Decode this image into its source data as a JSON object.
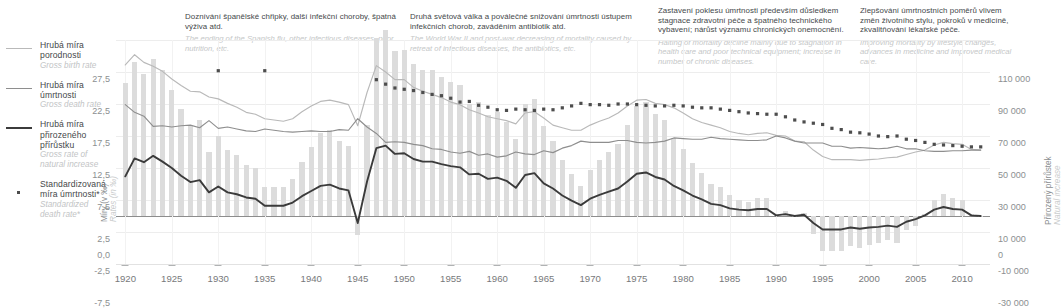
{
  "legend": {
    "items": [
      {
        "cz": "Hrubá míra porodnosti",
        "en": "Gross birth rate",
        "marker": "line-light",
        "color": "#b9b9b9"
      },
      {
        "cz": "Hrubá míra úmrtnosti",
        "en": "Gross death rate",
        "marker": "line-medium",
        "color": "#8e8e8e"
      },
      {
        "cz": "Hrubá míra přirozeného přírůstku",
        "en": "Gross rate of natural increase",
        "marker": "line-bold",
        "color": "#3b3b3b"
      },
      {
        "cz": "Standardizovaná míra úmrtnosti*",
        "en": "Standardized death rate*",
        "marker": "dot",
        "color": "#4d4d4d"
      }
    ]
  },
  "annotations": [
    {
      "cz": "Doznívání španělské chřipky, další infekční choroby, špatná výživa atd.",
      "en": "The ending of the Spanish flu, other infectious diseases, poor nutrition, etc."
    },
    {
      "cz": "Druhá světová válka a poválečné snižování úmrtnosti ústupem infekčních chorob, zaváděním antibiotik atd.",
      "en": "The World War II and post-war decreasing of mortality caused by retreat of infectious diseases, the antibiotics, etc."
    },
    {
      "cz": "Zastavení poklesu úmrtnosti především důsledkem stagnace zdravotní péče a špatného technického vybavení; nárůst významu chronických onemocnění.",
      "en": "Halting of mortality decline mainly due to stagnation in health care and poor technical equipment; increase in number of chronic diseases."
    },
    {
      "cz": "Zlepšování úmrtnostních poměrů vlivem změn životního stylu, pokroků v medicíně, zkvalitňování lékařské péče.",
      "en": "Improving mortality by lifestyle changes, advances in medicine and improved medical care."
    }
  ],
  "chart_data": {
    "type": "line",
    "title": "",
    "xlabel": "",
    "ylabel_left_cz": "Míry (v ‰)",
    "ylabel_left_en": "Rates (in ‰)",
    "ylabel_right_cz": "Přirozený přírůstek",
    "ylabel_right_en": "Natural increase",
    "ylim_left": [
      -7.5,
      27.5
    ],
    "ylim_right": [
      -30000,
      110000
    ],
    "yticks_left": [
      "27,5",
      "22,5",
      "17,5",
      "12,5",
      "7,5",
      "2,5",
      "0,0",
      "-2,5",
      "-7,5"
    ],
    "yticks_left_values": [
      27.5,
      22.5,
      17.5,
      12.5,
      7.5,
      2.5,
      0.0,
      -2.5,
      -7.5
    ],
    "yticks_right": [
      "110 000",
      "90 000",
      "70 000",
      "50 000",
      "30 000",
      "10 000",
      "0",
      "-10 000",
      "-30 000"
    ],
    "yticks_right_values": [
      110000,
      90000,
      70000,
      50000,
      30000,
      10000,
      0,
      -10000,
      -30000
    ],
    "xticks": [
      "1920",
      "1925",
      "1930",
      "1935",
      "1940",
      "1945",
      "1950",
      "1955",
      "1960",
      "1965",
      "1970",
      "1975",
      "1980",
      "1985",
      "1990",
      "1995",
      "2000",
      "2005",
      "2010"
    ],
    "xticks_values": [
      1920,
      1925,
      1930,
      1935,
      1940,
      1945,
      1950,
      1955,
      1960,
      1965,
      1970,
      1975,
      1980,
      1985,
      1990,
      1995,
      2000,
      2005,
      2010
    ],
    "xlim": [
      1919,
      2013
    ],
    "grid": true,
    "legend_position": "left-outside",
    "years": [
      1920,
      1921,
      1922,
      1923,
      1924,
      1925,
      1926,
      1927,
      1928,
      1929,
      1930,
      1931,
      1932,
      1933,
      1934,
      1935,
      1936,
      1937,
      1938,
      1939,
      1940,
      1941,
      1942,
      1943,
      1944,
      1945,
      1946,
      1947,
      1948,
      1949,
      1950,
      1951,
      1952,
      1953,
      1954,
      1955,
      1956,
      1957,
      1958,
      1959,
      1960,
      1961,
      1962,
      1963,
      1964,
      1965,
      1966,
      1967,
      1968,
      1969,
      1970,
      1971,
      1972,
      1973,
      1974,
      1975,
      1976,
      1977,
      1978,
      1979,
      1980,
      1981,
      1982,
      1983,
      1984,
      1985,
      1986,
      1987,
      1988,
      1989,
      1990,
      1991,
      1992,
      1993,
      1994,
      1995,
      1996,
      1997,
      1998,
      1999,
      2000,
      2001,
      2002,
      2003,
      2004,
      2005,
      2006,
      2007,
      2008,
      2009,
      2010,
      2011,
      2012
    ],
    "series": [
      {
        "name": "Hrubá míra porodnosti",
        "en_name": "Gross birth rate",
        "axis": "left",
        "style": "line-light",
        "color": "#b9b9b9",
        "values": [
          23.6,
          25.2,
          24.0,
          23.4,
          22.6,
          21.4,
          20.4,
          19.5,
          19.4,
          18.6,
          18.3,
          17.6,
          17.0,
          16.2,
          15.9,
          15.2,
          15.0,
          14.8,
          15.2,
          16.3,
          17.2,
          17.9,
          18.1,
          17.8,
          17.4,
          14.1,
          19.3,
          23.5,
          22.5,
          21.3,
          21.3,
          20.1,
          19.5,
          19.0,
          18.5,
          17.8,
          17.4,
          16.6,
          16.1,
          15.5,
          15.2,
          14.9,
          14.4,
          16.1,
          16.3,
          15.3,
          14.2,
          13.8,
          13.4,
          13.4,
          14.2,
          14.8,
          15.3,
          16.1,
          17.2,
          18.1,
          18.2,
          17.6,
          17.4,
          16.9,
          16.1,
          15.2,
          14.6,
          14.2,
          13.8,
          13.2,
          12.9,
          12.7,
          12.9,
          13.0,
          12.6,
          12.5,
          11.7,
          11.6,
          10.3,
          9.3,
          8.8,
          8.8,
          8.8,
          8.7,
          8.8,
          8.9,
          9.1,
          9.2,
          9.6,
          10.0,
          10.3,
          11.1,
          11.5,
          11.3,
          11.2,
          10.4,
          10.3
        ]
      },
      {
        "name": "Hrubá míra úmrtnosti",
        "en_name": "Gross death rate",
        "axis": "left",
        "style": "line-medium",
        "color": "#8e8e8e",
        "values": [
          17.4,
          16.2,
          15.6,
          14.0,
          14.1,
          13.9,
          14.1,
          14.2,
          13.8,
          14.9,
          13.7,
          13.9,
          13.6,
          13.3,
          13.2,
          13.6,
          13.4,
          13.2,
          13.1,
          13.2,
          13.3,
          13.2,
          13.2,
          13.5,
          13.4,
          15.2,
          13.9,
          12.9,
          11.5,
          11.6,
          11.5,
          11.2,
          11.0,
          10.5,
          10.4,
          10.0,
          9.8,
          10.1,
          9.5,
          9.7,
          9.2,
          9.4,
          10.0,
          9.7,
          9.6,
          10.2,
          9.9,
          10.6,
          11.0,
          11.7,
          11.5,
          11.5,
          11.5,
          11.8,
          11.8,
          11.5,
          11.4,
          11.5,
          11.7,
          12.2,
          12.1,
          12.0,
          12.0,
          12.3,
          12.1,
          12.0,
          11.9,
          11.8,
          11.8,
          11.9,
          12.5,
          12.2,
          11.7,
          11.4,
          11.4,
          11.4,
          10.9,
          10.9,
          10.6,
          10.7,
          10.6,
          10.5,
          10.6,
          10.9,
          10.5,
          10.5,
          10.2,
          10.1,
          10.1,
          10.2,
          10.2,
          10.3,
          10.3
        ]
      },
      {
        "name": "Hrubá míra přirozeného přírůstku",
        "en_name": "Gross rate of natural increase",
        "axis": "left",
        "style": "line-bold",
        "color": "#3b3b3b",
        "values": [
          6.2,
          9.0,
          8.4,
          9.4,
          8.5,
          7.5,
          6.3,
          5.3,
          5.6,
          3.7,
          4.6,
          3.7,
          3.4,
          2.9,
          2.7,
          1.6,
          1.6,
          1.6,
          2.1,
          3.1,
          3.9,
          4.7,
          4.9,
          4.3,
          4.0,
          -1.1,
          5.4,
          10.6,
          11.0,
          9.7,
          9.8,
          8.9,
          8.5,
          8.5,
          8.1,
          7.8,
          7.6,
          6.5,
          6.6,
          5.8,
          6.0,
          5.5,
          4.4,
          6.4,
          6.7,
          5.1,
          4.3,
          3.2,
          2.4,
          1.7,
          2.7,
          3.3,
          3.8,
          4.3,
          5.4,
          6.6,
          6.8,
          6.1,
          5.7,
          4.7,
          4.0,
          3.2,
          2.6,
          1.9,
          1.7,
          1.2,
          1.0,
          0.9,
          1.1,
          1.1,
          0.1,
          0.3,
          0.0,
          0.2,
          -1.1,
          -2.1,
          -2.1,
          -2.1,
          -1.8,
          -2.0,
          -1.8,
          -1.7,
          -1.5,
          -1.7,
          -0.9,
          -0.5,
          0.1,
          1.0,
          1.4,
          1.1,
          1.0,
          0.1,
          0.0
        ]
      },
      {
        "name": "Standardizovaná míra úmrtnosti*",
        "en_name": "Standardized death rate*",
        "axis": "left",
        "style": "dot",
        "color": "#4d4d4d",
        "values": [
          null,
          null,
          null,
          null,
          null,
          null,
          null,
          null,
          null,
          null,
          22.7,
          null,
          null,
          null,
          null,
          22.7,
          null,
          null,
          null,
          null,
          null,
          null,
          null,
          null,
          null,
          null,
          null,
          21.3,
          20.6,
          20.0,
          19.8,
          19.6,
          19.3,
          19.0,
          18.8,
          18.4,
          17.8,
          17.9,
          17.3,
          17.0,
          16.6,
          16.5,
          16.7,
          16.6,
          16.5,
          16.7,
          16.6,
          16.9,
          17.2,
          17.6,
          17.4,
          17.4,
          17.3,
          17.5,
          17.5,
          17.4,
          17.3,
          17.2,
          17.2,
          17.3,
          17.2,
          17.0,
          16.9,
          16.9,
          16.7,
          16.5,
          16.3,
          16.1,
          16.0,
          15.9,
          15.9,
          15.5,
          15.0,
          14.7,
          14.5,
          14.3,
          13.7,
          13.5,
          13.1,
          13.0,
          12.8,
          12.5,
          12.4,
          12.5,
          12.0,
          11.8,
          11.5,
          11.2,
          11.1,
          11.0,
          10.9,
          10.8,
          10.8
        ]
      }
    ],
    "bars": {
      "name": "Přirozený přírůstek",
      "en_name": "Natural increase",
      "axis": "right",
      "style": "bar",
      "color": "#dcdcdc",
      "values": [
        83000,
        96000,
        89000,
        98000,
        91000,
        79000,
        67000,
        56000,
        60000,
        40000,
        50000,
        41000,
        38000,
        32000,
        30000,
        18000,
        18000,
        18000,
        23000,
        34000,
        43000,
        52000,
        54000,
        47000,
        44000,
        -12000,
        57000,
        111000,
        116000,
        103000,
        104000,
        95000,
        91000,
        91000,
        87000,
        84000,
        82000,
        70000,
        71000,
        63000,
        65000,
        59000,
        48000,
        70000,
        73000,
        56000,
        47000,
        35000,
        26000,
        19000,
        29000,
        35000,
        40000,
        45000,
        57000,
        69000,
        71000,
        64000,
        60000,
        49000,
        42000,
        33000,
        27000,
        20000,
        18000,
        13000,
        10000,
        9000,
        11000,
        11000,
        1000,
        3000,
        0,
        2000,
        -11000,
        -22000,
        -22000,
        -22000,
        -19000,
        -20000,
        -18000,
        -17000,
        -15000,
        -17000,
        -9000,
        -6000,
        1000,
        10000,
        14000,
        11000,
        10000,
        1000,
        0
      ]
    },
    "footnote": ""
  },
  "axis": {
    "left_label_cz": "Míry (v ‰)",
    "left_label_en": "Rates (in ‰)",
    "right_label_cz": "Přirozený přírůstek",
    "right_label_en": "Natural increase"
  }
}
